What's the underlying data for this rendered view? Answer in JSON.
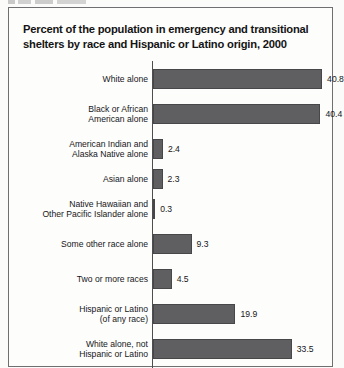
{
  "page": {
    "background_color": "#fbfbf9",
    "frame_border_color": "#6f6f72",
    "cut_off_text_above_frame": ""
  },
  "chart_data": {
    "type": "bar",
    "orientation": "horizontal",
    "title": "Percent of the population in emergency and transitional shelters by race and Hispanic or Latino origin, 2000",
    "title_line_1": "Percent of the population in emergency and transitional",
    "title_line_2": "shelters by race and Hispanic or Latino origin, 2000",
    "xlabel": "",
    "ylabel": "",
    "grid": false,
    "legend": false,
    "bar_color": "#5f5f61",
    "bar_border_color": "#47474a",
    "axis_color": "#4e4e50",
    "xlim": [
      0,
      44
    ],
    "value_suffix": "",
    "note": "bottom bar is cropped by the image edge",
    "categories": [
      "White alone",
      "Black or African American alone",
      "American Indian and Alaska Native alone",
      "Asian alone",
      "Native Hawaiian and Other Pacific Islander alone",
      "Some other race alone",
      "Two or more races",
      "Hispanic or Latino (of any race)",
      "White alone, not Hispanic or Latino"
    ],
    "values": [
      40.8,
      40.4,
      2.4,
      2.3,
      0.3,
      9.3,
      4.5,
      19.9,
      33.5
    ],
    "value_labels": [
      "40.8",
      "40.4",
      "2.4",
      "2.3",
      "0.3",
      "9.3",
      "4.5",
      "19.9",
      "33.5"
    ],
    "category_label_lines": [
      [
        "White alone"
      ],
      [
        "Black or African",
        "American alone"
      ],
      [
        "American Indian and",
        "Alaska Native alone"
      ],
      [
        "Asian alone"
      ],
      [
        "Native Hawaiian and",
        "Other Pacific Islander alone"
      ],
      [
        "Some other race alone"
      ],
      [
        "Two or more races"
      ],
      [
        "Hispanic or Latino",
        "(of any race)"
      ],
      [
        "White alone, not",
        "Hispanic or Latino"
      ]
    ]
  }
}
